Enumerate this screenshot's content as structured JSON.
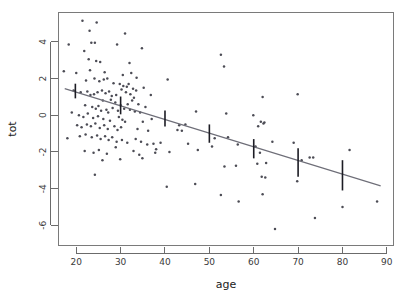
{
  "chart_data": {
    "type": "scatter",
    "title": "",
    "xlabel": "age",
    "ylabel": "tot",
    "xlim": [
      16.0,
      91.5
    ],
    "ylim": [
      -7.1,
      5.6
    ],
    "xticks": [
      20,
      30,
      40,
      50,
      60,
      70,
      80,
      90
    ],
    "xticklabels": [
      "20",
      "30",
      "40",
      "50",
      "60",
      "70",
      "80",
      "90"
    ],
    "yticks": [
      4,
      2,
      0,
      -2,
      -4,
      -6
    ],
    "yticklabels": [
      "4",
      "2",
      "0",
      "-2",
      "-4",
      "-6"
    ],
    "grid": false,
    "legend": null,
    "series": [
      {
        "name": "observations",
        "type": "scatter",
        "marker": "dot",
        "color": "#4c4c55",
        "points": [
          [
            21.4,
            5.15
          ],
          [
            24.6,
            5.05
          ],
          [
            23.0,
            4.6
          ],
          [
            31.0,
            4.45
          ],
          [
            18.3,
            3.85
          ],
          [
            23.4,
            3.95
          ],
          [
            24.2,
            3.95
          ],
          [
            29.2,
            3.85
          ],
          [
            21.8,
            3.5
          ],
          [
            34.8,
            3.65
          ],
          [
            52.6,
            3.3
          ],
          [
            22.8,
            3.05
          ],
          [
            24.5,
            2.95
          ],
          [
            25.4,
            2.9
          ],
          [
            32.0,
            2.85
          ],
          [
            53.3,
            2.65
          ],
          [
            17.2,
            2.4
          ],
          [
            20.0,
            2.3
          ],
          [
            23.1,
            2.45
          ],
          [
            26.4,
            2.35
          ],
          [
            30.5,
            2.2
          ],
          [
            32.4,
            2.3
          ],
          [
            33.6,
            2.05
          ],
          [
            40.6,
            1.95
          ],
          [
            22.2,
            1.9
          ],
          [
            24.1,
            2.0
          ],
          [
            25.2,
            1.85
          ],
          [
            26.2,
            1.95
          ],
          [
            27.0,
            2.0
          ],
          [
            28.4,
            1.75
          ],
          [
            29.8,
            1.7
          ],
          [
            30.6,
            1.6
          ],
          [
            31.4,
            1.55
          ],
          [
            31.8,
            1.7
          ],
          [
            32.8,
            1.45
          ],
          [
            33.5,
            1.35
          ],
          [
            35.2,
            1.5
          ],
          [
            36.8,
            1.1
          ],
          [
            62.0,
            1.0
          ],
          [
            69.9,
            1.15
          ],
          [
            19.4,
            1.35
          ],
          [
            21.0,
            1.25
          ],
          [
            22.5,
            1.3
          ],
          [
            23.2,
            1.1
          ],
          [
            24.0,
            1.15
          ],
          [
            24.8,
            1.25
          ],
          [
            25.8,
            1.35
          ],
          [
            26.6,
            1.2
          ],
          [
            27.4,
            1.3
          ],
          [
            28.0,
            1.05
          ],
          [
            29.0,
            1.1
          ],
          [
            30.2,
            1.4
          ],
          [
            31.2,
            1.25
          ],
          [
            32.2,
            1.15
          ],
          [
            33.0,
            0.95
          ],
          [
            26.0,
            0.8
          ],
          [
            27.8,
            0.85
          ],
          [
            28.8,
            0.7
          ],
          [
            30.0,
            0.55
          ],
          [
            31.6,
            0.6
          ],
          [
            32.6,
            0.8
          ],
          [
            34.0,
            0.6
          ],
          [
            35.6,
            0.45
          ],
          [
            47.0,
            0.2
          ],
          [
            53.8,
            0.1
          ],
          [
            59.9,
            0.0
          ],
          [
            22.0,
            0.55
          ],
          [
            23.6,
            0.45
          ],
          [
            24.4,
            0.35
          ],
          [
            25.0,
            0.5
          ],
          [
            25.6,
            0.25
          ],
          [
            26.8,
            0.3
          ],
          [
            27.2,
            0.15
          ],
          [
            28.2,
            0.4
          ],
          [
            29.4,
            0.25
          ],
          [
            30.8,
            0.35
          ],
          [
            32.1,
            0.3
          ],
          [
            33.2,
            0.2
          ],
          [
            34.4,
            0.15
          ],
          [
            19.0,
            0.15
          ],
          [
            20.6,
            0.0
          ],
          [
            21.6,
            -0.1
          ],
          [
            22.6,
            0.1
          ],
          [
            23.8,
            -0.15
          ],
          [
            24.9,
            -0.05
          ],
          [
            26.1,
            -0.2
          ],
          [
            27.6,
            -0.3
          ],
          [
            29.6,
            -0.1
          ],
          [
            30.4,
            -0.25
          ],
          [
            31.0,
            -0.35
          ],
          [
            35.0,
            -0.35
          ],
          [
            37.0,
            -0.2
          ],
          [
            43.2,
            -0.55
          ],
          [
            44.6,
            -0.5
          ],
          [
            61.6,
            -0.35
          ],
          [
            62.4,
            -0.4
          ],
          [
            20.2,
            -0.55
          ],
          [
            21.2,
            -0.65
          ],
          [
            22.4,
            -0.5
          ],
          [
            23.3,
            -0.6
          ],
          [
            24.3,
            -0.45
          ],
          [
            25.3,
            -0.7
          ],
          [
            26.3,
            -0.55
          ],
          [
            27.1,
            -0.75
          ],
          [
            28.6,
            -0.6
          ],
          [
            29.3,
            -0.8
          ],
          [
            30.1,
            -0.65
          ],
          [
            33.8,
            -0.75
          ],
          [
            36.2,
            -0.85
          ],
          [
            42.8,
            -0.8
          ],
          [
            43.8,
            -0.85
          ],
          [
            51.2,
            -1.25
          ],
          [
            54.2,
            -1.2
          ],
          [
            61.0,
            -0.6
          ],
          [
            62.2,
            -0.45
          ],
          [
            18.0,
            -1.25
          ],
          [
            20.8,
            -1.15
          ],
          [
            22.1,
            -1.05
          ],
          [
            23.5,
            -1.2
          ],
          [
            24.7,
            -1.1
          ],
          [
            25.5,
            -1.3
          ],
          [
            26.5,
            -1.15
          ],
          [
            27.3,
            -1.35
          ],
          [
            28.1,
            -1.2
          ],
          [
            29.1,
            -1.45
          ],
          [
            30.3,
            -1.35
          ],
          [
            31.5,
            -1.5
          ],
          [
            33.4,
            -1.3
          ],
          [
            34.6,
            -1.45
          ],
          [
            36.0,
            -1.6
          ],
          [
            37.4,
            -1.55
          ],
          [
            38.0,
            -1.85
          ],
          [
            39.0,
            -1.5
          ],
          [
            45.2,
            -1.55
          ],
          [
            47.4,
            -1.9
          ],
          [
            56.4,
            -1.6
          ],
          [
            64.2,
            -1.45
          ],
          [
            69.0,
            -1.5
          ],
          [
            21.9,
            -1.95
          ],
          [
            23.9,
            -2.05
          ],
          [
            25.1,
            -1.9
          ],
          [
            26.9,
            -2.1
          ],
          [
            28.9,
            -1.75
          ],
          [
            32.9,
            -1.95
          ],
          [
            34.2,
            -2.15
          ],
          [
            37.8,
            -2.05
          ],
          [
            41.0,
            -2.0
          ],
          [
            50.6,
            -1.7
          ],
          [
            60.4,
            -1.7
          ],
          [
            61.4,
            -2.05
          ],
          [
            25.9,
            -2.45
          ],
          [
            29.9,
            -2.4
          ],
          [
            34.9,
            -2.35
          ],
          [
            53.4,
            -2.8
          ],
          [
            56.0,
            -2.75
          ],
          [
            60.8,
            -2.65
          ],
          [
            62.8,
            -2.6
          ],
          [
            70.8,
            -2.45
          ],
          [
            72.6,
            -2.3
          ],
          [
            73.4,
            -2.3
          ],
          [
            81.6,
            -1.9
          ],
          [
            24.2,
            -3.25
          ],
          [
            40.4,
            -3.9
          ],
          [
            46.8,
            -3.75
          ],
          [
            61.8,
            -3.35
          ],
          [
            62.6,
            -3.4
          ],
          [
            62.0,
            -4.3
          ],
          [
            69.8,
            -3.6
          ],
          [
            52.6,
            -4.35
          ],
          [
            56.6,
            -4.7
          ],
          [
            80.0,
            -5.0
          ],
          [
            73.8,
            -5.6
          ],
          [
            64.8,
            -6.2
          ],
          [
            87.8,
            -4.7
          ]
        ]
      }
    ],
    "fit_line": {
      "name": "regression-line",
      "color": "#6e6e78",
      "x_start": 17.4,
      "y_start": 1.45,
      "x_end": 88.6,
      "y_end": -3.85
    },
    "error_bars": {
      "name": "confidence-intervals",
      "color": "#1c1c24",
      "bars": [
        {
          "x": 19.8,
          "center": 1.28,
          "low": 0.92,
          "high": 1.72
        },
        {
          "x": 30.0,
          "center": 0.55,
          "low": 0.05,
          "high": 1.02
        },
        {
          "x": 40.0,
          "center": -0.2,
          "low": -0.62,
          "high": 0.26
        },
        {
          "x": 50.0,
          "center": -1.0,
          "low": -1.5,
          "high": -0.5
        },
        {
          "x": 60.0,
          "center": -1.8,
          "low": -2.35,
          "high": -1.3
        },
        {
          "x": 70.0,
          "center": -2.5,
          "low": -3.35,
          "high": -1.8
        },
        {
          "x": 80.0,
          "center": -3.3,
          "low": -4.1,
          "high": -2.45
        }
      ]
    }
  },
  "figure": {
    "background": "#ffffff",
    "frame_color": "#7a7a7a",
    "axis_color": "#6b6b6b",
    "point_color": "#4c4c55",
    "line_color": "#6e6e78",
    "errorbar_color": "#1c1c24"
  }
}
